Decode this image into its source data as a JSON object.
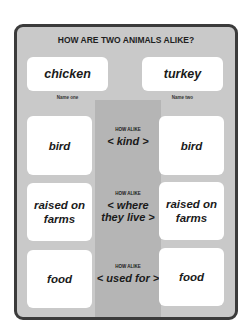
{
  "title": "HOW ARE TWO ANIMALS ALIKE?",
  "names": [
    {
      "value": "chicken",
      "label": "Name one"
    },
    {
      "value": "turkey",
      "label": "Name two"
    }
  ],
  "rows": [
    {
      "left": "bird",
      "how_label": "HOW ALIKE",
      "category": "< kind >",
      "right": "bird"
    },
    {
      "left": "raised on farms",
      "how_label": "HOW ALIKE",
      "category": "< where they live >",
      "right": "raised on farms"
    },
    {
      "left": "food",
      "how_label": "HOW ALIKE",
      "category": "< used for >",
      "right": "food"
    }
  ],
  "colors": {
    "panel": "#c9c9c9",
    "border": "#3b3b3b",
    "center": "#b5b5b5",
    "card": "#ffffff"
  }
}
